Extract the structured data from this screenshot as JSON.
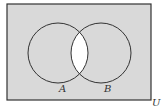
{
  "diagram": {
    "type": "venn",
    "universe_label": "U",
    "sets": [
      {
        "label": "A",
        "cx": 58,
        "cy": 53,
        "r": 30
      },
      {
        "label": "B",
        "cx": 101,
        "cy": 53,
        "r": 30
      }
    ],
    "shaded_region": "complement of A ∩ B",
    "unshaded_region": "A ∩ B",
    "colors": {
      "shade": "#d9d9d9",
      "unshaded": "#ffffff",
      "stroke": "#333333"
    },
    "rect": {
      "x": 7,
      "y": 4,
      "w": 144,
      "h": 96
    }
  }
}
